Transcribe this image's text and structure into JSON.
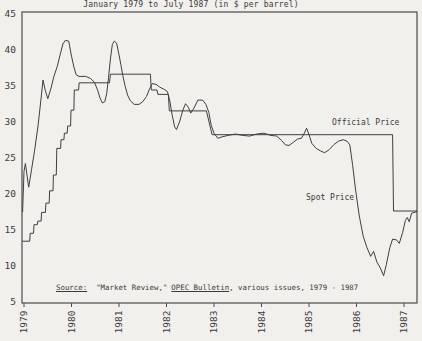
{
  "figure": {
    "title": "January 1979 to July 1987 (in $ per barrel)",
    "annotations": {
      "official": "Official Price",
      "spot": "Spot Price"
    },
    "source": {
      "label": "Source:",
      "part1": "\"Market Review,\"",
      "part2": "OPEC Bulletin",
      "part3": ", various issues, 1979 - 1987"
    }
  },
  "colors": {
    "paper": "#f2f0ec",
    "ink": "#3a3a3a",
    "line": "#3f3f3f",
    "frame": "#4a4a4a"
  },
  "chart_data": {
    "type": "line",
    "title": "January 1979 to July 1987 (in $ per barrel)",
    "xlabel": "",
    "ylabel": "$ per barrel",
    "xlim": [
      1978.95,
      1987.28
    ],
    "ylim": [
      5,
      45
    ],
    "grid": false,
    "legend_position": "inline-annotations",
    "xticks": [
      1979,
      1980,
      1981,
      1982,
      1983,
      1984,
      1985,
      1986,
      1987
    ],
    "yticks": [
      45,
      40,
      35,
      30,
      25,
      20,
      15,
      10,
      5
    ],
    "series": [
      {
        "name": "Official Price",
        "points": [
          [
            1978.97,
            13.3
          ],
          [
            1979.12,
            13.3
          ],
          [
            1979.13,
            14.4
          ],
          [
            1979.2,
            14.4
          ],
          [
            1979.21,
            15.6
          ],
          [
            1979.28,
            15.6
          ],
          [
            1979.29,
            16.1
          ],
          [
            1979.36,
            16.1
          ],
          [
            1979.37,
            17.3
          ],
          [
            1979.45,
            17.3
          ],
          [
            1979.46,
            18.6
          ],
          [
            1979.53,
            18.6
          ],
          [
            1979.54,
            20.3
          ],
          [
            1979.61,
            20.3
          ],
          [
            1979.62,
            22.5
          ],
          [
            1979.68,
            22.5
          ],
          [
            1979.69,
            26.2
          ],
          [
            1979.77,
            26.2
          ],
          [
            1979.78,
            27.4
          ],
          [
            1979.84,
            27.4
          ],
          [
            1979.85,
            28.3
          ],
          [
            1979.91,
            28.3
          ],
          [
            1979.92,
            29.3
          ],
          [
            1979.98,
            29.3
          ],
          [
            1979.99,
            31.5
          ],
          [
            1980.05,
            31.5
          ],
          [
            1980.06,
            34.3
          ],
          [
            1980.15,
            34.3
          ],
          [
            1980.16,
            35.3
          ],
          [
            1980.8,
            35.3
          ],
          [
            1980.82,
            36.5
          ],
          [
            1981.66,
            36.5
          ],
          [
            1981.68,
            34.3
          ],
          [
            1981.8,
            34.3
          ],
          [
            1981.82,
            33.7
          ],
          [
            1982.04,
            33.7
          ],
          [
            1982.06,
            31.4
          ],
          [
            1982.84,
            31.4
          ],
          [
            1982.96,
            28.1
          ],
          [
            1986.76,
            28.1
          ],
          [
            1986.78,
            17.5
          ],
          [
            1987.27,
            17.5
          ]
        ]
      },
      {
        "name": "Spot Price",
        "points": [
          [
            1978.97,
            17.4
          ],
          [
            1979.0,
            23.0
          ],
          [
            1979.03,
            24.1
          ],
          [
            1979.1,
            20.8
          ],
          [
            1979.16,
            23.3
          ],
          [
            1979.22,
            25.8
          ],
          [
            1979.3,
            29.5
          ],
          [
            1979.36,
            33.2
          ],
          [
            1979.4,
            35.7
          ],
          [
            1979.45,
            34.2
          ],
          [
            1979.5,
            33.1
          ],
          [
            1979.57,
            34.6
          ],
          [
            1979.63,
            36.2
          ],
          [
            1979.7,
            37.6
          ],
          [
            1979.76,
            39.2
          ],
          [
            1979.82,
            40.7
          ],
          [
            1979.87,
            41.2
          ],
          [
            1979.94,
            41.1
          ],
          [
            1980.0,
            39.0
          ],
          [
            1980.05,
            37.5
          ],
          [
            1980.1,
            36.4
          ],
          [
            1980.16,
            36.2
          ],
          [
            1980.3,
            36.2
          ],
          [
            1980.4,
            35.9
          ],
          [
            1980.48,
            35.4
          ],
          [
            1980.55,
            34.3
          ],
          [
            1980.6,
            33.2
          ],
          [
            1980.65,
            32.5
          ],
          [
            1980.7,
            32.7
          ],
          [
            1980.74,
            33.8
          ],
          [
            1980.78,
            36.0
          ],
          [
            1980.82,
            38.6
          ],
          [
            1980.86,
            40.6
          ],
          [
            1980.9,
            41.1
          ],
          [
            1980.95,
            40.8
          ],
          [
            1981.0,
            39.2
          ],
          [
            1981.04,
            37.8
          ],
          [
            1981.08,
            36.3
          ],
          [
            1981.13,
            34.8
          ],
          [
            1981.18,
            33.6
          ],
          [
            1981.24,
            32.8
          ],
          [
            1981.32,
            32.3
          ],
          [
            1981.42,
            32.3
          ],
          [
            1981.5,
            32.7
          ],
          [
            1981.58,
            33.4
          ],
          [
            1981.64,
            34.4
          ],
          [
            1981.7,
            35.2
          ],
          [
            1981.78,
            35.1
          ],
          [
            1981.86,
            34.7
          ],
          [
            1981.95,
            34.4
          ],
          [
            1982.02,
            34.1
          ],
          [
            1982.07,
            32.8
          ],
          [
            1982.12,
            30.8
          ],
          [
            1982.17,
            29.2
          ],
          [
            1982.21,
            28.8
          ],
          [
            1982.28,
            30.0
          ],
          [
            1982.34,
            31.4
          ],
          [
            1982.4,
            32.4
          ],
          [
            1982.46,
            31.9
          ],
          [
            1982.51,
            31.1
          ],
          [
            1982.58,
            31.8
          ],
          [
            1982.66,
            32.9
          ],
          [
            1982.76,
            32.9
          ],
          [
            1982.83,
            32.3
          ],
          [
            1982.89,
            31.2
          ],
          [
            1982.94,
            29.4
          ],
          [
            1983.0,
            28.3
          ],
          [
            1983.08,
            27.6
          ],
          [
            1983.17,
            27.8
          ],
          [
            1983.3,
            28.0
          ],
          [
            1983.45,
            28.2
          ],
          [
            1983.6,
            28.0
          ],
          [
            1983.75,
            27.9
          ],
          [
            1983.9,
            28.2
          ],
          [
            1984.05,
            28.3
          ],
          [
            1984.2,
            28.0
          ],
          [
            1984.32,
            27.9
          ],
          [
            1984.42,
            27.3
          ],
          [
            1984.5,
            26.7
          ],
          [
            1984.58,
            26.6
          ],
          [
            1984.68,
            27.1
          ],
          [
            1984.76,
            27.5
          ],
          [
            1984.84,
            27.6
          ],
          [
            1984.9,
            28.3
          ],
          [
            1984.95,
            29.0
          ],
          [
            1985.0,
            28.1
          ],
          [
            1985.06,
            26.9
          ],
          [
            1985.15,
            26.2
          ],
          [
            1985.25,
            25.8
          ],
          [
            1985.33,
            25.6
          ],
          [
            1985.42,
            26.0
          ],
          [
            1985.52,
            26.7
          ],
          [
            1985.62,
            27.2
          ],
          [
            1985.72,
            27.4
          ],
          [
            1985.8,
            27.2
          ],
          [
            1985.86,
            26.7
          ],
          [
            1985.92,
            23.8
          ],
          [
            1985.98,
            20.4
          ],
          [
            1986.06,
            16.8
          ],
          [
            1986.14,
            14.0
          ],
          [
            1986.22,
            12.4
          ],
          [
            1986.3,
            11.2
          ],
          [
            1986.36,
            11.9
          ],
          [
            1986.43,
            10.4
          ],
          [
            1986.5,
            9.6
          ],
          [
            1986.57,
            8.5
          ],
          [
            1986.63,
            10.1
          ],
          [
            1986.7,
            12.4
          ],
          [
            1986.76,
            13.6
          ],
          [
            1986.84,
            13.5
          ],
          [
            1986.9,
            13.0
          ],
          [
            1986.97,
            14.5
          ],
          [
            1987.03,
            16.2
          ],
          [
            1987.07,
            16.6
          ],
          [
            1987.11,
            16.0
          ],
          [
            1987.16,
            17.2
          ],
          [
            1987.27,
            17.4
          ]
        ]
      }
    ]
  }
}
